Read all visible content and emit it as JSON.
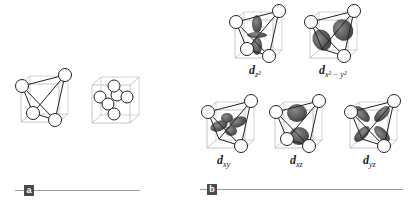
{
  "panels": [
    {
      "tag": "a",
      "figures": [
        "tetrahedral-geometry",
        "octahedral-geometry"
      ]
    },
    {
      "tag": "b",
      "orbitals": [
        {
          "label_main": "d",
          "label_sub": "z²"
        },
        {
          "label_main": "d",
          "label_sub": "x² − y²"
        },
        {
          "label_main": "d",
          "label_sub": "xy"
        },
        {
          "label_main": "d",
          "label_sub": "xz"
        },
        {
          "label_main": "d",
          "label_sub": "yz"
        }
      ]
    }
  ],
  "colors": {
    "lobe": "#5a5a5a",
    "tag_bg": "#4a4a4a",
    "rule": "#9a9a9a",
    "cube": "#b0b0b0"
  }
}
